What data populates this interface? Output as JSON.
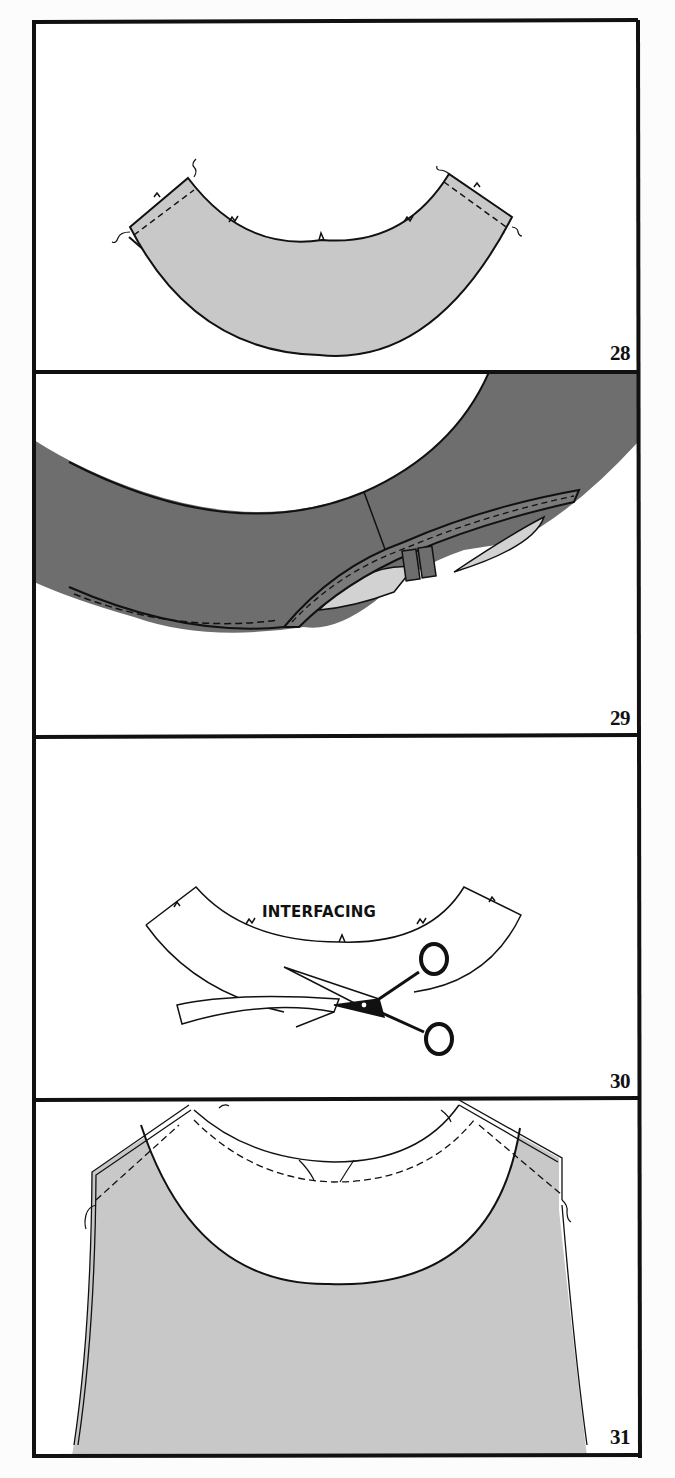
{
  "figures": [
    {
      "number": "28",
      "description": "Collar facing piece with shoulder seams stitched (light gray)"
    },
    {
      "number": "29",
      "description": "Neckline facing edge stitched and understitched (dark gray)"
    },
    {
      "number": "30",
      "description": "Trimming interfacing with scissors",
      "label": "INTERFACING"
    },
    {
      "number": "31",
      "description": "Facing pinned to bodice neckline with staystitching"
    }
  ],
  "colors": {
    "light_fabric": "#c8c8c8",
    "dark_fabric": "#6e6e6e",
    "lining": "#d2d2d2",
    "ink": "#111111",
    "paper": "#ffffff"
  }
}
